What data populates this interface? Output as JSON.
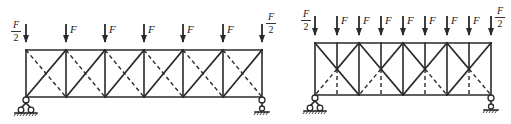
{
  "figure": {
    "left_truss": {
      "panels": 6,
      "bracing": "X-bracing: solid diagonal rising, dashed diagonal falling",
      "loads": {
        "end_label_num": "F",
        "end_label_den": "2",
        "interior_label": "F",
        "interior_count": 5
      },
      "supports": [
        "pin-left",
        "roller-right"
      ]
    },
    "right_truss": {
      "panels": 8,
      "bracing": "K-type with X crossing at mid-height; dashed lower half-diagonals and lower half of mid verticals",
      "loads": {
        "end_label_num": "F",
        "end_label_den": "2",
        "interior_label": "F",
        "interior_count": 7
      },
      "supports": [
        "pin-left",
        "roller-right"
      ]
    },
    "colors": {
      "line": "#2a2a2a",
      "background": "#ffffff"
    }
  }
}
